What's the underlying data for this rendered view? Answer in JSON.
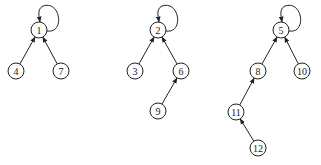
{
  "diagram": {
    "title": "",
    "node_radius": 8,
    "trees": [
      {
        "root": "1",
        "nodes": [
          {
            "id": "1",
            "label": "1",
            "x": 39,
            "y": 30
          },
          {
            "id": "4",
            "label": "4",
            "x": 16,
            "y": 71
          },
          {
            "id": "7",
            "label": "7",
            "x": 61,
            "y": 71
          }
        ],
        "edges": [
          {
            "from": "4",
            "to": "1"
          },
          {
            "from": "7",
            "to": "1"
          },
          {
            "from": "1",
            "to": "1",
            "self_loop": true
          }
        ]
      },
      {
        "root": "2",
        "nodes": [
          {
            "id": "2",
            "label": "2",
            "x": 158,
            "y": 30
          },
          {
            "id": "3",
            "label": "3",
            "x": 135,
            "y": 71
          },
          {
            "id": "6",
            "label": "6",
            "x": 181,
            "y": 71
          },
          {
            "id": "9",
            "label": "9",
            "x": 158,
            "y": 111
          }
        ],
        "edges": [
          {
            "from": "3",
            "to": "2"
          },
          {
            "from": "6",
            "to": "2"
          },
          {
            "from": "9",
            "to": "6"
          },
          {
            "from": "2",
            "to": "2",
            "self_loop": true
          }
        ]
      },
      {
        "root": "5",
        "nodes": [
          {
            "id": "5",
            "label": "5",
            "x": 281,
            "y": 30
          },
          {
            "id": "8",
            "label": "8",
            "x": 258,
            "y": 71
          },
          {
            "id": "10",
            "label": "10",
            "x": 302,
            "y": 71
          },
          {
            "id": "11",
            "label": "11",
            "x": 236,
            "y": 112
          },
          {
            "id": "12",
            "label": "12",
            "x": 258,
            "y": 148
          }
        ],
        "edges": [
          {
            "from": "8",
            "to": "5"
          },
          {
            "from": "10",
            "to": "5"
          },
          {
            "from": "11",
            "to": "8"
          },
          {
            "from": "12",
            "to": "11"
          },
          {
            "from": "5",
            "to": "5",
            "self_loop": true
          }
        ]
      }
    ]
  }
}
